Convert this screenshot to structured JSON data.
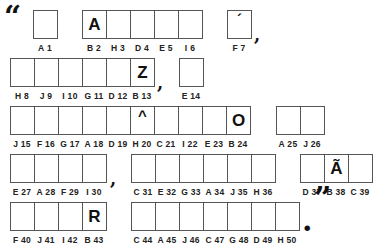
{
  "puzzle": {
    "open_quote": "“",
    "close_quote": "”",
    "rows": [
      {
        "groups": [
          {
            "x": 33,
            "y": 10,
            "cells": [
              {
                "clue": "A 1",
                "letter": "",
                "mark": ""
              }
            ]
          },
          {
            "x": 82,
            "y": 10,
            "cells": [
              {
                "clue": "B 2",
                "letter": "A",
                "mark": ""
              },
              {
                "clue": "H 3",
                "letter": "",
                "mark": ""
              },
              {
                "clue": "D 4",
                "letter": "",
                "mark": ""
              },
              {
                "clue": "E 5",
                "letter": "",
                "mark": ""
              },
              {
                "clue": "I 6",
                "letter": "",
                "mark": ""
              }
            ]
          },
          {
            "x": 227,
            "y": 10,
            "cells": [
              {
                "clue": "F 7",
                "letter": "",
                "mark": "´"
              }
            ]
          }
        ]
      },
      {
        "groups": [
          {
            "x": 10,
            "y": 58,
            "cells": [
              {
                "clue": "H 8",
                "letter": "",
                "mark": ""
              },
              {
                "clue": "J 9",
                "letter": "",
                "mark": ""
              },
              {
                "clue": "I 10",
                "letter": "",
                "mark": ""
              },
              {
                "clue": "G 11",
                "letter": "",
                "mark": ""
              },
              {
                "clue": "D 12",
                "letter": "",
                "mark": ""
              },
              {
                "clue": "B 13",
                "letter": "Z",
                "mark": ""
              }
            ]
          },
          {
            "x": 179,
            "y": 58,
            "cells": [
              {
                "clue": "E 14",
                "letter": "",
                "mark": ""
              }
            ]
          }
        ]
      },
      {
        "groups": [
          {
            "x": 10,
            "y": 106,
            "cells": [
              {
                "clue": "J 15",
                "letter": "",
                "mark": ""
              },
              {
                "clue": "F 16",
                "letter": "",
                "mark": ""
              },
              {
                "clue": "G 17",
                "letter": "",
                "mark": ""
              },
              {
                "clue": "A 18",
                "letter": "",
                "mark": ""
              },
              {
                "clue": "D 19",
                "letter": "",
                "mark": ""
              },
              {
                "clue": "H 20",
                "letter": "",
                "mark": "^"
              },
              {
                "clue": "C 21",
                "letter": "",
                "mark": ""
              },
              {
                "clue": "I 22",
                "letter": "",
                "mark": ""
              },
              {
                "clue": "E 23",
                "letter": "",
                "mark": ""
              },
              {
                "clue": "B 24",
                "letter": "O",
                "mark": ""
              }
            ]
          },
          {
            "x": 276,
            "y": 106,
            "cells": [
              {
                "clue": "A 25",
                "letter": "",
                "mark": ""
              },
              {
                "clue": "J 26",
                "letter": "",
                "mark": ""
              }
            ]
          }
        ]
      },
      {
        "groups": [
          {
            "x": 10,
            "y": 154,
            "cells": [
              {
                "clue": "E 27",
                "letter": "",
                "mark": ""
              },
              {
                "clue": "A 28",
                "letter": "",
                "mark": ""
              },
              {
                "clue": "F 29",
                "letter": "",
                "mark": ""
              },
              {
                "clue": "I 30",
                "letter": "",
                "mark": ""
              }
            ]
          },
          {
            "x": 131,
            "y": 154,
            "cells": [
              {
                "clue": "C 31",
                "letter": "",
                "mark": ""
              },
              {
                "clue": "E 32",
                "letter": "",
                "mark": ""
              },
              {
                "clue": "G 33",
                "letter": "",
                "mark": ""
              },
              {
                "clue": "A 34",
                "letter": "",
                "mark": ""
              },
              {
                "clue": "J 35",
                "letter": "",
                "mark": ""
              },
              {
                "clue": "H 36",
                "letter": "",
                "mark": ""
              }
            ]
          },
          {
            "x": 300,
            "y": 154,
            "cells": [
              {
                "clue": "D 37",
                "letter": "",
                "mark": ""
              },
              {
                "clue": "B 38",
                "letter": "Ã",
                "mark": ""
              },
              {
                "clue": "C 39",
                "letter": "",
                "mark": ""
              }
            ]
          }
        ]
      },
      {
        "groups": [
          {
            "x": 10,
            "y": 202,
            "cells": [
              {
                "clue": "F 40",
                "letter": "",
                "mark": ""
              },
              {
                "clue": "J 41",
                "letter": "",
                "mark": ""
              },
              {
                "clue": "I 42",
                "letter": "",
                "mark": ""
              },
              {
                "clue": "B 43",
                "letter": "R",
                "mark": ""
              }
            ]
          },
          {
            "x": 131,
            "y": 202,
            "cells": [
              {
                "clue": "C 44",
                "letter": "",
                "mark": ""
              },
              {
                "clue": "A 45",
                "letter": "",
                "mark": ""
              },
              {
                "clue": "J 46",
                "letter": "",
                "mark": ""
              },
              {
                "clue": "C 47",
                "letter": "",
                "mark": ""
              },
              {
                "clue": "G 48",
                "letter": "",
                "mark": ""
              },
              {
                "clue": "D 49",
                "letter": "",
                "mark": ""
              },
              {
                "clue": "H 50",
                "letter": "",
                "mark": ""
              }
            ]
          }
        ]
      }
    ],
    "punctuation": [
      {
        "id": "open-quote",
        "char": "“",
        "x": 4,
        "y": 2,
        "size": 30
      },
      {
        "id": "comma-after-f7",
        "char": ",",
        "x": 254,
        "y": 26,
        "size": 18
      },
      {
        "id": "comma-after-b13",
        "char": ",",
        "x": 157,
        "y": 74,
        "size": 18
      },
      {
        "id": "comma-after-i30",
        "char": ",",
        "x": 110,
        "y": 170,
        "size": 18
      },
      {
        "id": "period-after-h50",
        "char": ".",
        "x": 302,
        "y": 206,
        "size": 30
      },
      {
        "id": "close-quote",
        "char": "”",
        "x": 314,
        "y": 183,
        "size": 30
      }
    ]
  }
}
